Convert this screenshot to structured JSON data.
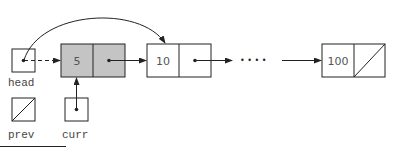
{
  "diagram": {
    "type": "linked-list",
    "colors": {
      "stroke": "#222222",
      "shaded_fill": "#c4c4c4",
      "plain_fill": "#ffffff",
      "text": "#555555"
    },
    "pointers": [
      {
        "label": "head",
        "null": false
      },
      {
        "label": "prev",
        "null": true
      },
      {
        "label": "curr",
        "null": false
      }
    ],
    "nodes": [
      {
        "value": "5",
        "shaded": true,
        "next_null": false
      },
      {
        "value": "10",
        "shaded": false,
        "next_null": false
      },
      {
        "value": "100",
        "shaded": false,
        "next_null": true
      }
    ],
    "ellipsis": "• • • •",
    "edges": [
      {
        "from": "head",
        "to": "node-5",
        "style": "dashed"
      },
      {
        "from": "head",
        "to": "node-10",
        "style": "curved-solid"
      },
      {
        "from": "curr",
        "to": "node-5",
        "style": "solid"
      },
      {
        "from": "node-5",
        "to": "node-10",
        "style": "solid"
      },
      {
        "from": "node-10",
        "to": "ellipsis",
        "style": "solid"
      },
      {
        "from": "ellipsis",
        "to": "node-100",
        "style": "solid"
      }
    ]
  }
}
